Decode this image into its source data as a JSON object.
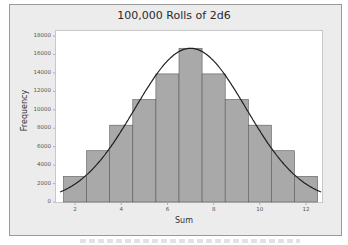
{
  "chart_data": {
    "type": "bar",
    "title": "100,000 Rolls of 2d6",
    "xlabel": "Sum",
    "ylabel": "Frequency",
    "categories": [
      "2",
      "3",
      "4",
      "5",
      "6",
      "7",
      "8",
      "9",
      "10",
      "11",
      "12"
    ],
    "values": [
      2780,
      5560,
      8330,
      11110,
      13890,
      16670,
      13890,
      11110,
      8330,
      5560,
      2780
    ],
    "overlay": {
      "type": "normal_curve",
      "mean": 7,
      "sd": 2.415
    },
    "ylim": [
      0,
      18000
    ],
    "yticks": [
      0,
      2000,
      4000,
      6000,
      8000,
      10000,
      12000,
      14000,
      16000,
      18000
    ],
    "xticks": [
      2,
      4,
      6,
      8,
      10,
      12
    ],
    "grid": false,
    "legend": null
  },
  "labels": {
    "title": "100,000 Rolls of 2d6",
    "xlabel": "Sum",
    "ylabel": "Frequency",
    "yticks": [
      "0",
      "2000",
      "4000",
      "6000",
      "8000",
      "10000",
      "12000",
      "14000",
      "16000",
      "18000"
    ],
    "xticks": [
      "2",
      "4",
      "6",
      "8",
      "10",
      "12"
    ]
  },
  "colors": {
    "bar_fill": "#a9a9a9",
    "bar_stroke": "#5a5a5a",
    "curve": "#1e1e1e",
    "frame_bg": "#ececec"
  }
}
